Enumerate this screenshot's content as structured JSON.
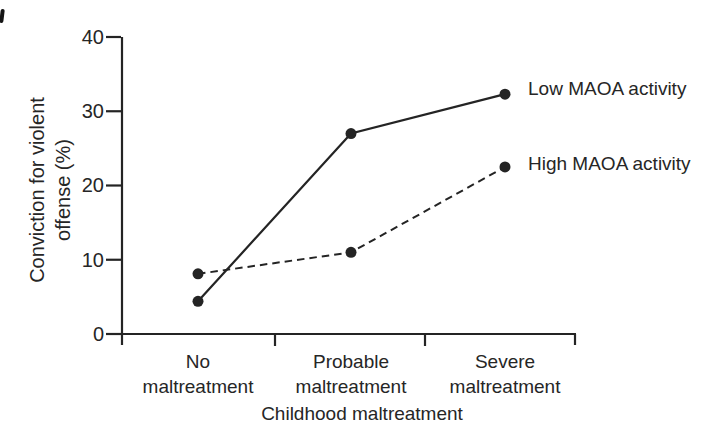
{
  "figure": {
    "background": "#ffffff",
    "ink_color": "#242424"
  },
  "chart_data": {
    "type": "line",
    "title": "",
    "xlabel": "Childhood maltreatment",
    "ylabel": "Conviction for violent offense (%)",
    "ylabel_line1": "Conviction for violent",
    "ylabel_line2": "offense (%)",
    "categories": [
      "No maltreatment",
      "Probable maltreatment",
      "Severe maltreatment"
    ],
    "category_labels": [
      {
        "line1": "No",
        "line2": "maltreatment"
      },
      {
        "line1": "Probable",
        "line2": "maltreatment"
      },
      {
        "line1": "Severe",
        "line2": "maltreatment"
      }
    ],
    "series": [
      {
        "name": "Low MAOA activity",
        "style": "solid",
        "values": [
          4.4,
          27,
          32.3
        ]
      },
      {
        "name": "High MAOA activity",
        "style": "dashed",
        "values": [
          8.1,
          11,
          22.5
        ]
      }
    ],
    "ylim": [
      0,
      40
    ],
    "yticks": [
      0,
      10,
      20,
      30,
      40
    ],
    "ytick_labels": [
      "0",
      "10",
      "20",
      "30",
      "40"
    ],
    "grid": false,
    "marker": "filled-circle",
    "legend_position": "right-of-last-point"
  }
}
